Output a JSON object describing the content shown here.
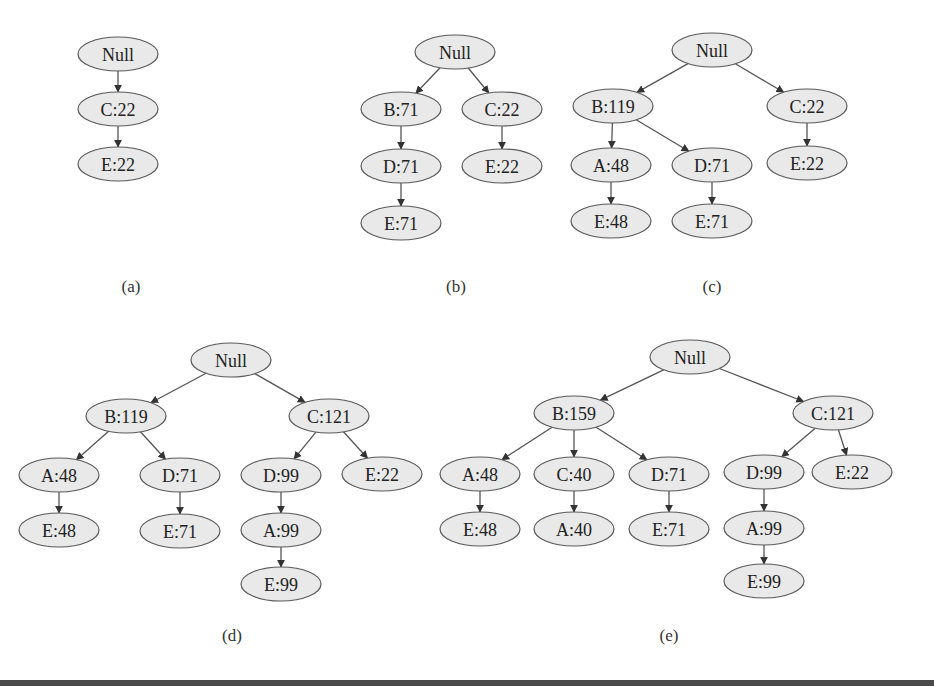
{
  "figure": {
    "type": "fp-tree-construction",
    "panels": [
      {
        "id": "a",
        "caption": "(a)",
        "caption_pos": [
          131,
          286
        ],
        "nodes": [
          {
            "id": "null",
            "label": "Null",
            "x": 118,
            "y": 54
          },
          {
            "id": "c",
            "label": "C:22",
            "x": 118,
            "y": 109
          },
          {
            "id": "e",
            "label": "E:22",
            "x": 118,
            "y": 164
          }
        ],
        "edges": [
          [
            "null",
            "c"
          ],
          [
            "c",
            "e"
          ]
        ]
      },
      {
        "id": "b",
        "caption": "(b)",
        "caption_pos": [
          456,
          286
        ],
        "nodes": [
          {
            "id": "null",
            "label": "Null",
            "x": 455,
            "y": 52
          },
          {
            "id": "b",
            "label": "B:71",
            "x": 401,
            "y": 109
          },
          {
            "id": "c",
            "label": "C:22",
            "x": 502,
            "y": 109
          },
          {
            "id": "d",
            "label": "D:71",
            "x": 401,
            "y": 166
          },
          {
            "id": "e2",
            "label": "E:22",
            "x": 502,
            "y": 166
          },
          {
            "id": "e1",
            "label": "E:71",
            "x": 401,
            "y": 223
          }
        ],
        "edges": [
          [
            "null",
            "b"
          ],
          [
            "null",
            "c"
          ],
          [
            "b",
            "d"
          ],
          [
            "d",
            "e1"
          ],
          [
            "c",
            "e2"
          ]
        ]
      },
      {
        "id": "c",
        "caption": "(c)",
        "caption_pos": [
          712,
          286
        ],
        "nodes": [
          {
            "id": "null",
            "label": "Null",
            "x": 712,
            "y": 50
          },
          {
            "id": "b",
            "label": "B:119",
            "x": 613,
            "y": 106
          },
          {
            "id": "c",
            "label": "C:22",
            "x": 807,
            "y": 106
          },
          {
            "id": "a",
            "label": "A:48",
            "x": 611,
            "y": 165
          },
          {
            "id": "d",
            "label": "D:71",
            "x": 712,
            "y": 165
          },
          {
            "id": "e3",
            "label": "E:22",
            "x": 807,
            "y": 163
          },
          {
            "id": "e1",
            "label": "E:48",
            "x": 611,
            "y": 221
          },
          {
            "id": "e2",
            "label": "E:71",
            "x": 712,
            "y": 221
          }
        ],
        "edges": [
          [
            "null",
            "b"
          ],
          [
            "null",
            "c"
          ],
          [
            "b",
            "a"
          ],
          [
            "b",
            "d"
          ],
          [
            "a",
            "e1"
          ],
          [
            "d",
            "e2"
          ],
          [
            "c",
            "e3"
          ]
        ]
      },
      {
        "id": "d",
        "caption": "(d)",
        "caption_pos": [
          232,
          635
        ],
        "nodes": [
          {
            "id": "null",
            "label": "Null",
            "x": 231,
            "y": 360
          },
          {
            "id": "b",
            "label": "B:119",
            "x": 126,
            "y": 416
          },
          {
            "id": "c",
            "label": "C:121",
            "x": 329,
            "y": 416
          },
          {
            "id": "a",
            "label": "A:48",
            "x": 59,
            "y": 475
          },
          {
            "id": "d",
            "label": "D:71",
            "x": 180,
            "y": 475
          },
          {
            "id": "d2",
            "label": "D:99",
            "x": 281,
            "y": 475
          },
          {
            "id": "e4",
            "label": "E:22",
            "x": 382,
            "y": 474
          },
          {
            "id": "e1",
            "label": "E:48",
            "x": 59,
            "y": 530
          },
          {
            "id": "e2",
            "label": "E:71",
            "x": 180,
            "y": 531
          },
          {
            "id": "a2",
            "label": "A:99",
            "x": 281,
            "y": 530
          },
          {
            "id": "e3",
            "label": "E:99",
            "x": 281,
            "y": 584
          }
        ],
        "edges": [
          [
            "null",
            "b"
          ],
          [
            "null",
            "c"
          ],
          [
            "b",
            "a"
          ],
          [
            "b",
            "d"
          ],
          [
            "a",
            "e1"
          ],
          [
            "d",
            "e2"
          ],
          [
            "c",
            "d2"
          ],
          [
            "c",
            "e4"
          ],
          [
            "d2",
            "a2"
          ],
          [
            "a2",
            "e3"
          ]
        ]
      },
      {
        "id": "e",
        "caption": "(e)",
        "caption_pos": [
          669,
          635
        ],
        "nodes": [
          {
            "id": "null",
            "label": "Null",
            "x": 690,
            "y": 357
          },
          {
            "id": "b",
            "label": "B:159",
            "x": 574,
            "y": 413
          },
          {
            "id": "c",
            "label": "C:121",
            "x": 833,
            "y": 413
          },
          {
            "id": "a",
            "label": "A:48",
            "x": 480,
            "y": 474
          },
          {
            "id": "c2",
            "label": "C:40",
            "x": 574,
            "y": 474
          },
          {
            "id": "d",
            "label": "D:71",
            "x": 669,
            "y": 474
          },
          {
            "id": "d2",
            "label": "D:99",
            "x": 764,
            "y": 472
          },
          {
            "id": "e4",
            "label": "E:22",
            "x": 852,
            "y": 472
          },
          {
            "id": "e1",
            "label": "E:48",
            "x": 480,
            "y": 529
          },
          {
            "id": "a3",
            "label": "A:40",
            "x": 574,
            "y": 529
          },
          {
            "id": "e2",
            "label": "E:71",
            "x": 669,
            "y": 529
          },
          {
            "id": "a2",
            "label": "A:99",
            "x": 764,
            "y": 528
          },
          {
            "id": "e3",
            "label": "E:99",
            "x": 764,
            "y": 581
          }
        ],
        "edges": [
          [
            "null",
            "b"
          ],
          [
            "null",
            "c"
          ],
          [
            "b",
            "a"
          ],
          [
            "b",
            "c2"
          ],
          [
            "b",
            "d"
          ],
          [
            "a",
            "e1"
          ],
          [
            "c2",
            "a3"
          ],
          [
            "d",
            "e2"
          ],
          [
            "c",
            "d2"
          ],
          [
            "c",
            "e4"
          ],
          [
            "d2",
            "a2"
          ],
          [
            "a2",
            "e3"
          ]
        ]
      }
    ]
  },
  "style": {
    "node_fill": "#e9e9e9",
    "node_stroke": "#5a5a5a",
    "edge_color": "#555555",
    "text_color": "#222222"
  }
}
